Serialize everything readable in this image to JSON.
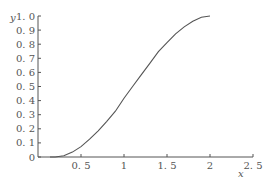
{
  "chart_data": {
    "type": "line",
    "title": "",
    "xlabel": "x",
    "ylabel": "y",
    "xlim": [
      0,
      2.5
    ],
    "ylim": [
      0,
      1.0
    ],
    "grid": false,
    "legend": null,
    "x_ticks": [
      "0.5",
      "1",
      "1.5",
      "2",
      "2.5"
    ],
    "y_ticks": [
      "0",
      "0.1",
      "0.2",
      "0.3",
      "0.4",
      "0.5",
      "0.6",
      "0.7",
      "0.8",
      "0.9",
      "1.0"
    ],
    "series": [
      {
        "name": "curve",
        "x": [
          0.2,
          0.3,
          0.4,
          0.5,
          0.6,
          0.7,
          0.8,
          0.9,
          1.0,
          1.1,
          1.2,
          1.3,
          1.4,
          1.5,
          1.6,
          1.7,
          1.8,
          1.9,
          2.0
        ],
        "y": [
          0.0,
          0.009,
          0.035,
          0.074,
          0.126,
          0.186,
          0.253,
          0.325,
          0.417,
          0.5,
          0.583,
          0.664,
          0.747,
          0.811,
          0.873,
          0.923,
          0.963,
          0.991,
          1.0
        ]
      }
    ],
    "colors": {
      "axis": "#555555",
      "line": "#555555"
    }
  }
}
